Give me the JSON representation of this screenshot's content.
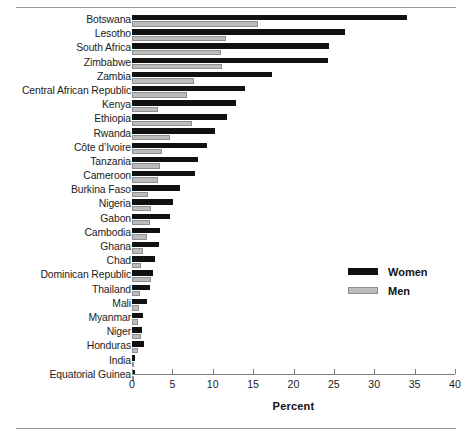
{
  "chart_data": {
    "type": "bar",
    "orientation": "horizontal",
    "title": "",
    "xlabel": "Percent",
    "ylabel": "",
    "xlim": [
      0,
      40
    ],
    "xticks": [
      0,
      5,
      10,
      15,
      20,
      25,
      30,
      35,
      40
    ],
    "xtick_labels": [
      "0",
      "5",
      "10",
      "15",
      "20",
      "25",
      "30",
      "35",
      "40"
    ],
    "grid": false,
    "legend_position": "center-right",
    "categories": [
      "Botswana",
      "Lesotho",
      "South Africa",
      "Zimbabwe",
      "Zambia",
      "Central African Republic",
      "Kenya",
      "Ethiopia",
      "Rwanda",
      "Côte d’Ivoire",
      "Tanzania",
      "Cameroon",
      "Burkina Faso",
      "Nigeria",
      "Gabon",
      "Cambodia",
      "Ghana",
      "Chad",
      "Dominican Republic",
      "Thailand",
      "Mali",
      "Myanmar",
      "Niger",
      "Honduras",
      "India",
      "Equatorial Guinea"
    ],
    "series": [
      {
        "name": "Women",
        "color": "#111111",
        "values": [
          34.0,
          26.4,
          24.4,
          24.3,
          17.3,
          14.0,
          12.9,
          11.8,
          10.3,
          9.3,
          8.2,
          7.8,
          5.9,
          5.1,
          4.7,
          3.5,
          3.3,
          2.9,
          2.6,
          2.2,
          1.9,
          1.4,
          1.3,
          1.5,
          0.4,
          0.4
        ]
      },
      {
        "name": "Men",
        "color": "#bcbcbc",
        "values": [
          15.6,
          11.6,
          11.0,
          11.1,
          7.7,
          6.8,
          3.2,
          7.4,
          4.7,
          3.7,
          3.5,
          3.2,
          2.0,
          2.4,
          2.2,
          1.9,
          1.4,
          1.1,
          2.4,
          1.0,
          0.9,
          0.8,
          1.1,
          0.7,
          0.3,
          0.2
        ]
      }
    ]
  },
  "legend": {
    "items": [
      {
        "label": "Women",
        "color": "#111111"
      },
      {
        "label": "Men",
        "color": "#bcbcbc"
      }
    ]
  },
  "axis": {
    "x_title": "Percent"
  }
}
